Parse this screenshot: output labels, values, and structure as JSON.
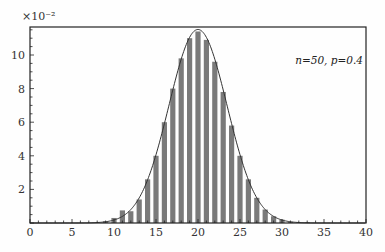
{
  "chart_data": {
    "type": "bar",
    "title": "",
    "xlabel": "",
    "ylabel": "",
    "y_multiplier_label": "×10⁻²",
    "annotation": "n=50, p=0.4",
    "xlim": [
      0,
      40
    ],
    "ylim": [
      0,
      11.6
    ],
    "x_ticks": [
      0,
      5,
      10,
      15,
      20,
      25,
      30,
      35,
      40
    ],
    "y_ticks": [
      2,
      4,
      6,
      8,
      10
    ],
    "grid": false,
    "legend": "none",
    "series": [
      {
        "name": "Binomial pmf (×10⁻²)",
        "type": "bar",
        "x": [
          8,
          9,
          10,
          11,
          12,
          13,
          14,
          15,
          16,
          17,
          18,
          19,
          20,
          21,
          22,
          23,
          24,
          25,
          26,
          27,
          28,
          29,
          30,
          31,
          32,
          33
        ],
        "values": [
          0.03,
          0.1,
          0.3,
          0.75,
          0.7,
          1.4,
          2.6,
          4.0,
          6.0,
          8.0,
          9.8,
          11.0,
          11.4,
          10.9,
          9.6,
          7.8,
          5.8,
          4.0,
          2.6,
          1.5,
          0.8,
          0.4,
          0.2,
          0.07,
          0.03,
          0.01
        ]
      },
      {
        "name": "Normal approximation",
        "type": "line",
        "mean": 20,
        "sd": 3.4641,
        "peak": 11.52
      }
    ]
  }
}
